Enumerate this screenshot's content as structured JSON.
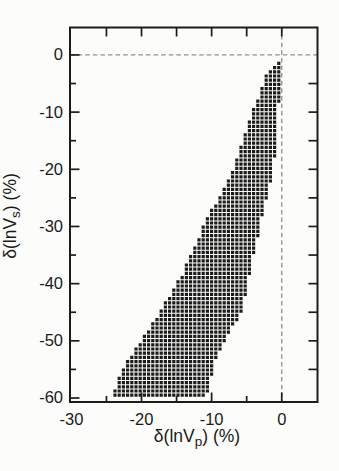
{
  "figure": {
    "background": "#fcfcfb",
    "ink_color": "#1a1a1a",
    "frame_color": "#1c1c1c",
    "dashed_line_color": "#8f8f8f",
    "band_color": "#1c1c1c"
  },
  "chart_data": {
    "type": "area",
    "title": "",
    "xlabel": {
      "prefix": "δ(lnV",
      "sub": "p",
      "suffix": ") (%)"
    },
    "ylabel": {
      "prefix": "δ(lnV",
      "sub": "s",
      "suffix": ") (%)"
    },
    "xlim": [
      -30.2,
      5.1
    ],
    "ylim": [
      -60.7,
      4.8
    ],
    "grid": false,
    "legend": null,
    "x_tick_labels": [
      {
        "v": -30,
        "label": "-30"
      },
      {
        "v": -20,
        "label": "-20"
      },
      {
        "v": -10,
        "label": "-10"
      },
      {
        "v": 0,
        "label": "0"
      }
    ],
    "y_tick_labels": [
      {
        "v": 0,
        "label": "0"
      },
      {
        "v": -10,
        "label": "-10"
      },
      {
        "v": -20,
        "label": "-20"
      },
      {
        "v": -30,
        "label": "-30"
      },
      {
        "v": -40,
        "label": "-40"
      },
      {
        "v": -50,
        "label": "-50"
      },
      {
        "v": -60,
        "label": "-60"
      }
    ],
    "x_major_ticks": [
      -20,
      -10,
      0
    ],
    "x_minor_ticks": [
      -25,
      -15,
      -5
    ],
    "y_major_ticks": [
      0,
      -10,
      -20,
      -30,
      -40,
      -50,
      -60
    ],
    "y_minor_ticks": [
      -5,
      -15,
      -25,
      -35,
      -45,
      -55
    ],
    "top_ticks": [
      -25,
      -20,
      -15,
      -10,
      -5,
      0
    ],
    "right_ticks": [
      -5,
      -10,
      -15,
      -20,
      -25,
      -30,
      -35,
      -40,
      -45,
      -50,
      -55
    ],
    "reference_lines": {
      "horizontal_y": 0,
      "vertical_x": 0,
      "style": "dashed"
    },
    "band": {
      "description": "admissible-solution region filled with a square grid of black dots",
      "dot_period_px": 4.2,
      "dot_size_px": 3.2,
      "tip": [
        -0.64,
        -1.2
      ],
      "bottom_y": -59.5,
      "left_edge": [
        [
          -0.64,
          -1.2
        ],
        [
          -2.2,
          -3
        ],
        [
          -3.1,
          -6.5
        ],
        [
          -4.8,
          -12
        ],
        [
          -6.0,
          -16.5
        ],
        [
          -7.3,
          -21
        ],
        [
          -10.9,
          -29
        ],
        [
          -13.9,
          -37.5
        ],
        [
          -17.3,
          -44.5
        ],
        [
          -20.2,
          -50
        ],
        [
          -22.8,
          -55
        ],
        [
          -24.1,
          -59.5
        ]
      ],
      "right_edge": [
        [
          -0.64,
          -1.2
        ],
        [
          -0.55,
          -3
        ],
        [
          -0.65,
          -5
        ],
        [
          -1.0,
          -9
        ],
        [
          -1.4,
          -15
        ],
        [
          -1.7,
          -20
        ],
        [
          -2.5,
          -24
        ],
        [
          -3.5,
          -29
        ],
        [
          -4.4,
          -34
        ],
        [
          -5.2,
          -39
        ],
        [
          -6.3,
          -44.5
        ],
        [
          -7.3,
          -47
        ],
        [
          -8.4,
          -49
        ],
        [
          -9.8,
          -52.5
        ],
        [
          -10.5,
          -55.5
        ],
        [
          -11.3,
          -59.5
        ]
      ]
    }
  }
}
